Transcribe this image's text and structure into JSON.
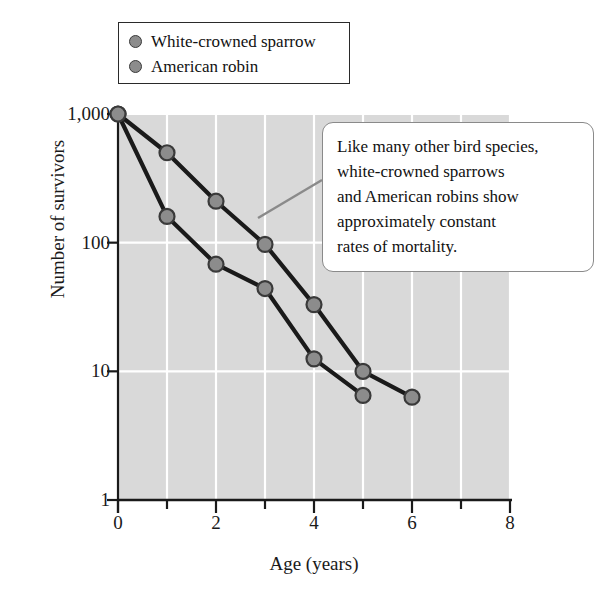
{
  "chart_data": {
    "type": "line",
    "title": "",
    "xlabel": "Age (years)",
    "ylabel": "Number of survivors",
    "xlim": [
      0,
      8
    ],
    "ylim": [
      1,
      1000
    ],
    "yscale": "log",
    "grid": true,
    "legend_position": "top-left",
    "x_ticks": [
      "0",
      "2",
      "4",
      "6",
      "8"
    ],
    "x_tick_values": [
      0,
      2,
      4,
      6,
      8
    ],
    "x_minor_ticks": [
      1,
      3,
      5,
      7
    ],
    "y_ticks": [
      "1,000",
      "100",
      "10",
      "1"
    ],
    "y_tick_values": [
      1000,
      100,
      10,
      1
    ],
    "series": [
      {
        "name": "White-crowned sparrow",
        "color": "#8c8c8c",
        "line_color": "#1a1a1a",
        "x": [
          0,
          1,
          2,
          3,
          4,
          5,
          6
        ],
        "values": [
          1000,
          500,
          210,
          97,
          33,
          10,
          6.3
        ]
      },
      {
        "name": "American robin",
        "color": "#8c8c8c",
        "line_color": "#1a1a1a",
        "x": [
          0,
          1,
          2,
          3,
          4,
          5
        ],
        "values": [
          1000,
          160,
          68,
          44,
          12.5,
          6.5
        ]
      }
    ],
    "annotations": [
      {
        "text": "Like many other bird species, white-crowned sparrows and American robins show approximately constant rates of mortality.",
        "lines": [
          "Like many other bird species,",
          "white-crowned sparrows",
          "and American robins show",
          "approximately constant",
          "rates of mortality."
        ],
        "points_to_series": "White-crowned sparrow"
      }
    ]
  },
  "legend": {
    "items": [
      {
        "label": "White-crowned sparrow",
        "marker": "circle-marker"
      },
      {
        "label": "American robin",
        "marker": "circle-marker"
      }
    ]
  },
  "colors": {
    "plot_background": "#d9d9d9",
    "gridline": "#ffffff",
    "axis": "#1a1a1a",
    "marker_fill": "#8c8c8c",
    "marker_stroke": "#3a3a3a",
    "callout_border": "#8a8a8a",
    "callout_background": "#ffffff"
  }
}
